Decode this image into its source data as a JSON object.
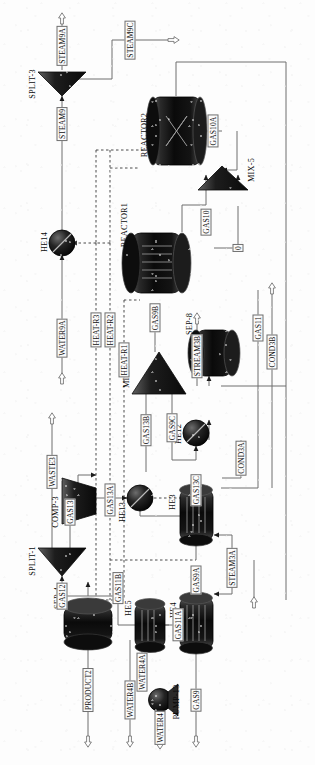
{
  "diagram": {
    "orientation": "rotated-90-ccw",
    "background_color": "#fdfdfd",
    "line_color": "#6e6e6e",
    "equipment_fill_dark": "#1a1a1a"
  },
  "blocks": [
    {
      "id": "split3",
      "label": "SPLIT-3",
      "type": "splitter"
    },
    {
      "id": "reactor2",
      "label": "REACTOR2",
      "type": "reactor-packed"
    },
    {
      "id": "reactor1",
      "label": "REACTOR1",
      "type": "reactor-tubular"
    },
    {
      "id": "mix5",
      "label": "MIX-5",
      "type": "mixer"
    },
    {
      "id": "he14",
      "label": "HE14",
      "type": "heat-exchanger-circular"
    },
    {
      "id": "mix7",
      "label": "MIX-7",
      "type": "mixer"
    },
    {
      "id": "sep8",
      "label": "SEP-8",
      "type": "separator"
    },
    {
      "id": "he12",
      "label": "HE12",
      "type": "heat-exchanger-circular"
    },
    {
      "id": "he13",
      "label": "HE13",
      "type": "heat-exchanger-circular"
    },
    {
      "id": "he3",
      "label": "HE3",
      "type": "heat-exchanger-shell"
    },
    {
      "id": "split1",
      "label": "SPLIT-1",
      "type": "splitter"
    },
    {
      "id": "comp3",
      "label": "COMP-3",
      "type": "compressor"
    },
    {
      "id": "sep4",
      "label": "SEP-4",
      "type": "separator"
    },
    {
      "id": "he5",
      "label": "HE5",
      "type": "heat-exchanger-shell"
    },
    {
      "id": "he4",
      "label": "HE4",
      "type": "heat-exchanger-shell"
    },
    {
      "id": "pump13",
      "label": "PUMP-13",
      "type": "pump"
    }
  ],
  "streams": [
    {
      "id": "steam9a",
      "label": "STEAM9A"
    },
    {
      "id": "steam9c",
      "label": "STEAM9C"
    },
    {
      "id": "steam9",
      "label": "STEAM9"
    },
    {
      "id": "gas10a",
      "label": "GAS10A"
    },
    {
      "id": "gas10",
      "label": "GAS10"
    },
    {
      "id": "zero",
      "label": "0"
    },
    {
      "id": "gas9b",
      "label": "GAS9B"
    },
    {
      "id": "water9a",
      "label": "WATER9A"
    },
    {
      "id": "heatr3",
      "label": "HEAT-R3"
    },
    {
      "id": "heatr2",
      "label": "HEAT-R2"
    },
    {
      "id": "heatr1",
      "label": "HEAT-R1"
    },
    {
      "id": "gas13b",
      "label": "GAS13B"
    },
    {
      "id": "gas9c",
      "label": "GAS9C"
    },
    {
      "id": "stream3b",
      "label": "STREAM3B"
    },
    {
      "id": "gas11",
      "label": "GAS11"
    },
    {
      "id": "cond3b",
      "label": "COND3B"
    },
    {
      "id": "cond3a",
      "label": "COND3A"
    },
    {
      "id": "gas13c",
      "label": "GAS13C"
    },
    {
      "id": "gas9a",
      "label": "GAS9A"
    },
    {
      "id": "steam3a",
      "label": "STEAM3A"
    },
    {
      "id": "waste3",
      "label": "WASTE3"
    },
    {
      "id": "gas13",
      "label": "GAS13"
    },
    {
      "id": "gas13a",
      "label": "GAS13A"
    },
    {
      "id": "gas12",
      "label": "GAS12"
    },
    {
      "id": "gas11b",
      "label": "GAS11B"
    },
    {
      "id": "gas11a",
      "label": "GAS11A"
    },
    {
      "id": "water4a",
      "label": "WATER4A"
    },
    {
      "id": "water4b",
      "label": "WATER4B"
    },
    {
      "id": "water4",
      "label": "WATER4"
    },
    {
      "id": "product2",
      "label": "PRODUCT2"
    },
    {
      "id": "gas9",
      "label": "GAS9"
    }
  ]
}
